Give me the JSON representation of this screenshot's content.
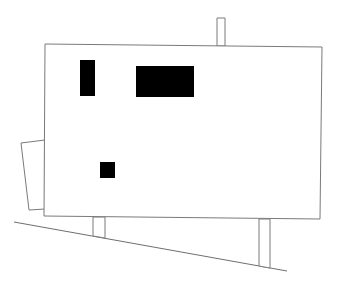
{
  "drawing": {
    "type": "architectural-elevation",
    "colors": {
      "background": "#ffffff",
      "line": "#7a7a7a",
      "opening_fill": "#000000"
    },
    "ground_line": {
      "x1": 14,
      "y1": 222,
      "x2": 287,
      "y2": 271
    },
    "main_volume": {
      "points": "45,44 322,47 320,219 44,216"
    },
    "chimney": {
      "points": "217,18 225,18 225,46 217,46"
    },
    "left_annex": {
      "points": "45,140 21,143 29,210 45,209"
    },
    "supports": [
      {
        "name": "support-left",
        "points": "93,217 105,217 105,238 93,236"
      },
      {
        "name": "support-right",
        "points": "259,219 270,219 270,268 259,266"
      }
    ],
    "openings": [
      {
        "name": "window-tall",
        "x": 80,
        "y": 60,
        "width": 15,
        "height": 36
      },
      {
        "name": "window-wide",
        "x": 136,
        "y": 66,
        "width": 58,
        "height": 31
      },
      {
        "name": "window-small",
        "x": 100,
        "y": 162,
        "width": 15,
        "height": 16
      }
    ]
  }
}
